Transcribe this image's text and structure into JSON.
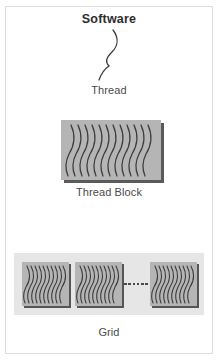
{
  "figure": {
    "title": "Software",
    "border_color": "#dcdcdc",
    "background": "#ffffff"
  },
  "thread": {
    "label": "Thread",
    "icon": "wavy-thread-curve",
    "stroke_color": "#3c3c3c"
  },
  "thread_block": {
    "label": "Thread Block",
    "icon": "thread-block-box",
    "fill_color": "#b5b5b5",
    "shadow_color": "#5a5a5a",
    "thread_count": 12
  },
  "grid": {
    "label": "Grid",
    "panel_color": "#e6e6e6",
    "blocks": [
      {
        "name": "thread-block-0",
        "fill_color": "#b5b5b5",
        "thread_count": 10
      },
      {
        "name": "thread-block-1",
        "fill_color": "#b5b5b5",
        "thread_count": 10
      },
      {
        "name": "thread-block-n",
        "fill_color": "#b5b5b5",
        "thread_count": 10
      }
    ],
    "ellipsis": {
      "name": "grid-ellipsis",
      "dot_count": 6,
      "dot_color": "#4a4a4a"
    }
  }
}
